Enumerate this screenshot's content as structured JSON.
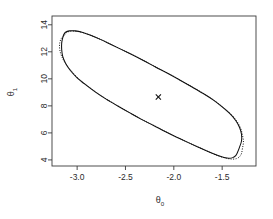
{
  "chart_data": {
    "type": "line",
    "title": "",
    "subtitle": "",
    "xlabel": "θ",
    "xlabel_sub": "0",
    "ylabel": "θ",
    "ylabel_sub": "1",
    "xlim": [
      -3.26,
      -1.15
    ],
    "ylim": [
      3.55,
      14.65
    ],
    "xticks": [
      -3.0,
      -2.5,
      -2.0,
      -1.5
    ],
    "xtick_labels": [
      "-3.0",
      "-2.5",
      "-2.0",
      "-1.5"
    ],
    "yticks": [
      4,
      6,
      8,
      10,
      12,
      14
    ],
    "ytick_labels": [
      "4",
      "6",
      "8",
      "10",
      "12",
      "14"
    ],
    "grid": false,
    "legend": "none",
    "point_estimate": {
      "label": "MLE",
      "marker": "x",
      "theta0": -2.16,
      "theta1": 8.65
    },
    "series": [
      {
        "name": "Wald confidence region",
        "style": "solid",
        "closed": true,
        "points": [
          [
            -3.14,
            13.25
          ],
          [
            -3.12,
            13.45
          ],
          [
            -3.08,
            13.55
          ],
          [
            -3.02,
            13.55
          ],
          [
            -2.95,
            13.45
          ],
          [
            -2.86,
            13.22
          ],
          [
            -2.76,
            12.92
          ],
          [
            -2.66,
            12.58
          ],
          [
            -2.55,
            12.2
          ],
          [
            -2.43,
            11.78
          ],
          [
            -2.31,
            11.34
          ],
          [
            -2.19,
            10.88
          ],
          [
            -2.06,
            10.4
          ],
          [
            -1.94,
            9.92
          ],
          [
            -1.82,
            9.43
          ],
          [
            -1.7,
            8.93
          ],
          [
            -1.59,
            8.42
          ],
          [
            -1.5,
            7.92
          ],
          [
            -1.42,
            7.42
          ],
          [
            -1.36,
            6.92
          ],
          [
            -1.32,
            6.4
          ],
          [
            -1.3,
            5.9
          ],
          [
            -1.3,
            5.4
          ],
          [
            -1.32,
            4.95
          ],
          [
            -1.34,
            4.58
          ],
          [
            -1.36,
            4.32
          ],
          [
            -1.39,
            4.17
          ],
          [
            -1.43,
            4.12
          ],
          [
            -1.48,
            4.18
          ],
          [
            -1.55,
            4.34
          ],
          [
            -1.64,
            4.6
          ],
          [
            -1.74,
            4.92
          ],
          [
            -1.85,
            5.28
          ],
          [
            -1.97,
            5.68
          ],
          [
            -2.09,
            6.1
          ],
          [
            -2.21,
            6.55
          ],
          [
            -2.34,
            7.02
          ],
          [
            -2.46,
            7.5
          ],
          [
            -2.58,
            7.99
          ],
          [
            -2.7,
            8.5
          ],
          [
            -2.81,
            9.02
          ],
          [
            -2.91,
            9.55
          ],
          [
            -3.0,
            10.08
          ],
          [
            -3.07,
            10.62
          ],
          [
            -3.12,
            11.16
          ],
          [
            -3.15,
            11.68
          ],
          [
            -3.16,
            12.18
          ],
          [
            -3.16,
            12.64
          ],
          [
            -3.15,
            13.02
          ],
          [
            -3.14,
            13.25
          ]
        ]
      },
      {
        "name": "Likelihood confidence region",
        "style": "dotted",
        "closed": true,
        "points": [
          [
            -3.13,
            13.22
          ],
          [
            -3.11,
            13.42
          ],
          [
            -3.07,
            13.52
          ],
          [
            -3.01,
            13.52
          ],
          [
            -2.94,
            13.42
          ],
          [
            -2.85,
            13.19
          ],
          [
            -2.75,
            12.89
          ],
          [
            -2.65,
            12.55
          ],
          [
            -2.54,
            12.17
          ],
          [
            -2.42,
            11.75
          ],
          [
            -2.3,
            11.31
          ],
          [
            -2.18,
            10.85
          ],
          [
            -2.05,
            10.37
          ],
          [
            -1.93,
            9.89
          ],
          [
            -1.81,
            9.4
          ],
          [
            -1.69,
            8.9
          ],
          [
            -1.58,
            8.39
          ],
          [
            -1.49,
            7.89
          ],
          [
            -1.41,
            7.39
          ],
          [
            -1.35,
            6.88
          ],
          [
            -1.31,
            6.36
          ],
          [
            -1.29,
            5.84
          ],
          [
            -1.28,
            5.32
          ],
          [
            -1.29,
            4.86
          ],
          [
            -1.3,
            4.48
          ],
          [
            -1.32,
            4.24
          ],
          [
            -1.35,
            4.1
          ],
          [
            -1.4,
            4.06
          ],
          [
            -1.46,
            4.13
          ],
          [
            -1.54,
            4.3
          ],
          [
            -1.63,
            4.57
          ],
          [
            -1.73,
            4.89
          ],
          [
            -1.84,
            5.25
          ],
          [
            -1.96,
            5.65
          ],
          [
            -2.08,
            6.07
          ],
          [
            -2.2,
            6.52
          ],
          [
            -2.33,
            6.99
          ],
          [
            -2.45,
            7.47
          ],
          [
            -2.57,
            7.96
          ],
          [
            -2.69,
            8.47
          ],
          [
            -2.8,
            8.99
          ],
          [
            -2.9,
            9.52
          ],
          [
            -2.99,
            10.05
          ],
          [
            -3.06,
            10.59
          ],
          [
            -3.12,
            11.14
          ],
          [
            -3.16,
            11.67
          ],
          [
            -3.18,
            12.18
          ],
          [
            -3.18,
            12.66
          ],
          [
            -3.16,
            13.04
          ],
          [
            -3.13,
            13.22
          ]
        ]
      }
    ]
  },
  "plot_geometry": {
    "frame_left": 52,
    "frame_right": 256,
    "frame_top": 16,
    "frame_bottom": 166
  }
}
